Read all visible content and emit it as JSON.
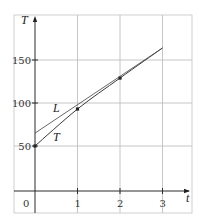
{
  "chart_data": {
    "type": "line",
    "title": "",
    "xlabel": "t",
    "ylabel": "T",
    "x_ticks": [
      0,
      1,
      2,
      3
    ],
    "x_tick_labels": [
      "0",
      "1",
      "2",
      "3"
    ],
    "y_ticks": [
      50,
      100,
      150
    ],
    "y_tick_labels": [
      "50",
      "100",
      "150"
    ],
    "xlim": [
      0,
      3.6
    ],
    "ylim": [
      -30,
      205
    ],
    "grid": true,
    "series": [
      {
        "name": "T",
        "label": "T",
        "kind": "curve-with-points",
        "x": [
          0,
          1,
          2,
          3
        ],
        "y": [
          50,
          93,
          129,
          164
        ],
        "points_marked": [
          [
            0,
            50
          ],
          [
            1,
            93
          ],
          [
            2,
            129
          ]
        ]
      },
      {
        "name": "L",
        "label": "L",
        "kind": "straight-line",
        "x": [
          0,
          3
        ],
        "y": [
          65,
          164
        ]
      }
    ],
    "annotations": [
      {
        "text": "L",
        "x": 0.5,
        "y": 94
      },
      {
        "text": "T",
        "x": 0.52,
        "y": 60
      }
    ]
  },
  "labels": {
    "y_axis": "T",
    "x_axis": "t",
    "origin": "0",
    "curve_T": "T",
    "line_L": "L"
  }
}
